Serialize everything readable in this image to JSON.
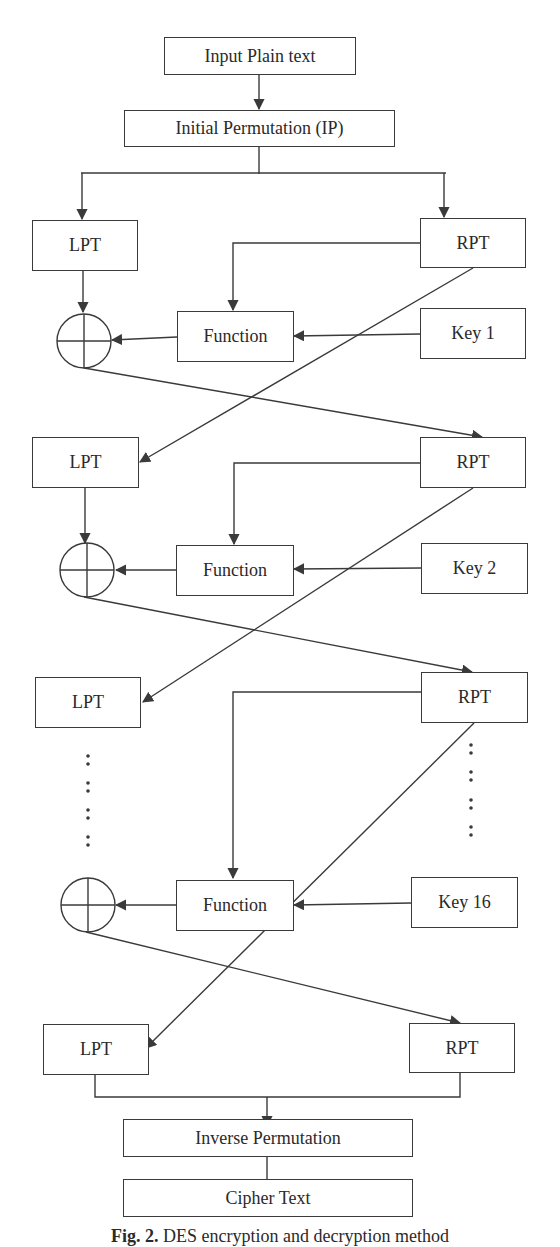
{
  "nodes": {
    "input": "Input Plain text",
    "ip": "Initial Permutation (IP)",
    "round1": {
      "lpt": "LPT",
      "rpt": "RPT",
      "function": "Function",
      "key": "Key 1"
    },
    "round2": {
      "lpt": "LPT",
      "rpt": "RPT",
      "function": "Function",
      "key": "Key 2"
    },
    "round3": {
      "lpt": "LPT",
      "rpt": "RPT"
    },
    "round16": {
      "function": "Function",
      "key": "Key 16"
    },
    "final": {
      "lpt": "LPT",
      "rpt": "RPT"
    },
    "inverse": "Inverse Permutation",
    "cipher": "Cipher Text"
  },
  "caption": {
    "label": "Fig. 2.",
    "text": "DES encryption and decryption method"
  },
  "colors": {
    "stroke": "#3a3a3a",
    "text": "#2a2a2a",
    "background": "#ffffff"
  }
}
